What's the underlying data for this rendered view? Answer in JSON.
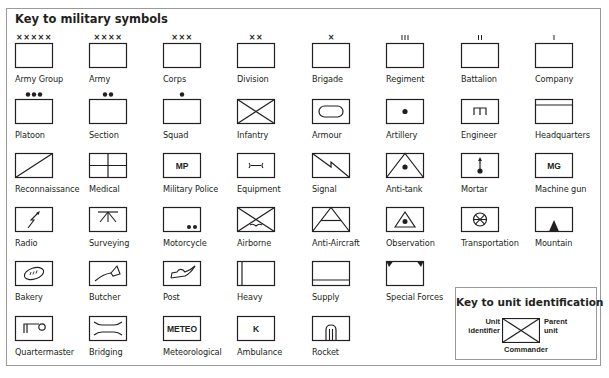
{
  "title": "Key to military symbols",
  "symbols": [
    {
      "label": "Army Group",
      "icon": "army-group-icon",
      "marker": "XXXXX"
    },
    {
      "label": "Army",
      "icon": "army-icon",
      "marker": "XXXX"
    },
    {
      "label": "Corps",
      "icon": "corps-icon",
      "marker": "XXX"
    },
    {
      "label": "Division",
      "icon": "division-icon",
      "marker": "XX"
    },
    {
      "label": "Brigade",
      "icon": "brigade-icon",
      "marker": "X"
    },
    {
      "label": "Regiment",
      "icon": "regiment-icon",
      "marker": "III"
    },
    {
      "label": "Battalion",
      "icon": "battalion-icon",
      "marker": "II"
    },
    {
      "label": "Company",
      "icon": "company-icon",
      "marker": "I"
    },
    {
      "label": "Platoon",
      "icon": "platoon-icon",
      "marker": "●●●"
    },
    {
      "label": "Section",
      "icon": "section-icon",
      "marker": "●●"
    },
    {
      "label": "Squad",
      "icon": "squad-icon",
      "marker": "●"
    },
    {
      "label": "Infantry",
      "icon": "infantry-icon"
    },
    {
      "label": "Armour",
      "icon": "armour-icon"
    },
    {
      "label": "Artillery",
      "icon": "artillery-icon"
    },
    {
      "label": "Engineer",
      "icon": "engineer-icon"
    },
    {
      "label": "Headquarters",
      "icon": "headquarters-icon"
    },
    {
      "label": "Reconnaissance",
      "icon": "reconnaissance-icon"
    },
    {
      "label": "Medical",
      "icon": "medical-icon"
    },
    {
      "label": "Military Police",
      "icon": "military-police-icon",
      "text": "MP"
    },
    {
      "label": "Equipment",
      "icon": "equipment-icon"
    },
    {
      "label": "Signal",
      "icon": "signal-icon"
    },
    {
      "label": "Anti-tank",
      "icon": "anti-tank-icon"
    },
    {
      "label": "Mortar",
      "icon": "mortar-icon"
    },
    {
      "label": "Machine gun",
      "icon": "machine-gun-icon",
      "text": "MG"
    },
    {
      "label": "Radio",
      "icon": "radio-icon"
    },
    {
      "label": "Surveying",
      "icon": "surveying-icon"
    },
    {
      "label": "Motorcycle",
      "icon": "motorcycle-icon"
    },
    {
      "label": "Airborne",
      "icon": "airborne-icon"
    },
    {
      "label": "Anti-Aircraft",
      "icon": "anti-aircraft-icon"
    },
    {
      "label": "Observation",
      "icon": "observation-icon"
    },
    {
      "label": "Transportation",
      "icon": "transportation-icon"
    },
    {
      "label": "Mountain",
      "icon": "mountain-icon"
    },
    {
      "label": "Bakery",
      "icon": "bakery-icon"
    },
    {
      "label": "Butcher",
      "icon": "butcher-icon"
    },
    {
      "label": "Post",
      "icon": "post-icon"
    },
    {
      "label": "Heavy",
      "icon": "heavy-icon"
    },
    {
      "label": "Supply",
      "icon": "supply-icon"
    },
    {
      "label": "Special Forces",
      "icon": "special-forces-icon"
    },
    {
      "label": "Quartermaster",
      "icon": "quartermaster-icon"
    },
    {
      "label": "Bridging",
      "icon": "bridging-icon"
    },
    {
      "label": "Meteorological",
      "icon": "meteorological-icon",
      "text": "METEO"
    },
    {
      "label": "Ambulance",
      "icon": "ambulance-icon",
      "text": "K"
    },
    {
      "label": "Rocket",
      "icon": "rocket-icon"
    }
  ],
  "unit_identification": {
    "title": "Key to unit identification",
    "left_label_1": "Unit",
    "left_label_2": "identifier",
    "right_label_1": "Parent",
    "right_label_2": "unit",
    "bottom_label": "Commander"
  }
}
